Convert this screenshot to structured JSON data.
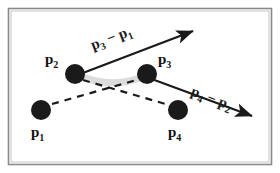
{
  "figure": {
    "background_color": "#ffffff",
    "frame": {
      "name": "figure-border",
      "outer_color": "#8a8a8a",
      "inner_color": "#b8b8b8",
      "inset_px": 8
    },
    "points": [
      {
        "id": "p1",
        "main": "p",
        "sub": "1",
        "label": "p1",
        "cx": 41,
        "cy": 110,
        "r": 10,
        "color": "#1a1a1a",
        "label_x": 31,
        "label_y": 137
      },
      {
        "id": "p2",
        "main": "p",
        "sub": "2",
        "label": "p2",
        "cx": 75,
        "cy": 74,
        "r": 10,
        "color": "#1a1a1a",
        "label_x": 45,
        "label_y": 64
      },
      {
        "id": "p3",
        "main": "p",
        "sub": "3",
        "label": "p3",
        "cx": 147,
        "cy": 74,
        "r": 10,
        "color": "#1a1a1a",
        "label_x": 158,
        "label_y": 64
      },
      {
        "id": "p4",
        "main": "p",
        "sub": "4",
        "label": "p4",
        "cx": 178,
        "cy": 110,
        "r": 10,
        "color": "#1a1a1a",
        "label_x": 168,
        "label_y": 137
      }
    ],
    "arrows": [
      {
        "id": "arrow-p3-minus-p1",
        "label_main_1": "p",
        "label_sub_1": "3",
        "label_minus": " − ",
        "label_main_2": "p",
        "label_sub_2": "1",
        "label_text": "p3 − p1",
        "x1": 75,
        "y1": 76,
        "x2": 193,
        "y2": 31,
        "color": "#1a1a1a",
        "width": 2.2,
        "label_x": 93,
        "label_y": 50,
        "label_rotate": -21
      },
      {
        "id": "arrow-p4-minus-p2",
        "label_main_1": "p",
        "label_sub_1": "4",
        "label_minus": " − ",
        "label_main_2": "p",
        "label_sub_2": "2",
        "label_text": "p4 − p2",
        "x1": 149,
        "y1": 78,
        "x2": 252,
        "y2": 116,
        "color": "#1a1a1a",
        "width": 2.2,
        "label_x": 190,
        "label_y": 95,
        "label_rotate": 21
      }
    ],
    "connector_band": {
      "id": "band-p2-p3",
      "name": "gray-connector-band",
      "color": "#dcdcdc",
      "width": 7,
      "path": "M 78 75 Q 111 90 145 76"
    },
    "dashed_lines": [
      {
        "id": "dash-p1-p3",
        "x1": 52,
        "y1": 104,
        "x2": 140,
        "y2": 79,
        "color": "#1a1a1a",
        "width": 2.2,
        "dash": "7 6"
      },
      {
        "id": "dash-p2-p4",
        "x1": 83,
        "y1": 80,
        "x2": 169,
        "y2": 105,
        "color": "#1a1a1a",
        "width": 2.2,
        "dash": "7 6"
      }
    ]
  }
}
